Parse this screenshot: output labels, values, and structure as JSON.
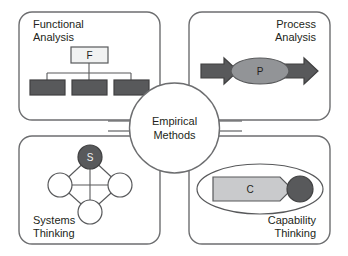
{
  "diagram": {
    "title": "Empirical Methods",
    "hub": {
      "line1": "Empirical",
      "line2": "Methods"
    },
    "colors": {
      "panel_border": "#6d6e70",
      "dark": "#58595b",
      "mid": "#929497",
      "light": "#c9cacc",
      "pale": "#f1f2f2",
      "white": "#ffffff",
      "text": "#231f20"
    },
    "panels": [
      {
        "id": "functional-analysis",
        "label_line1": "Functional",
        "label_line2": "Analysis",
        "label_align": "top-left",
        "node_glyph": "F",
        "child_count": 3
      },
      {
        "id": "process-analysis",
        "label_line1": "Process",
        "label_line2": "Analysis",
        "label_align": "top-right",
        "node_glyph": "P",
        "arrow_count": 2
      },
      {
        "id": "systems-thinking",
        "label_line1": "Systems",
        "label_line2": "Thinking",
        "label_align": "bottom-left",
        "node_glyph": "S",
        "plain_node_count": 3
      },
      {
        "id": "capability-thinking",
        "label_line1": "Capability",
        "label_line2": "Thinking",
        "label_align": "bottom-right",
        "node_glyph": "C",
        "endpoint_count": 1
      }
    ]
  }
}
